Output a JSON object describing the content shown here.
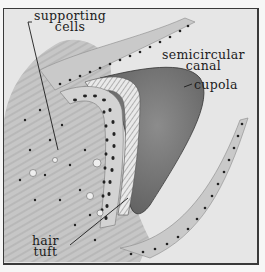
{
  "figure": {
    "style": "monochrome histology illustration",
    "colors": {
      "background": "#e6e6e6",
      "frame": "#3a3a3a",
      "cupola": "#7a7a7a",
      "nuclei": "#222222",
      "tissue": "#b9b9b9",
      "ink": "#1c1c1c"
    }
  },
  "labels": {
    "supporting_cells": {
      "line1": "supporting",
      "line2": "cells"
    },
    "semicircular_canal": {
      "line1": "semicircular",
      "line2": "canal"
    },
    "cupola": {
      "line1": "cupola"
    },
    "hair_tuft": {
      "line1": "hair",
      "line2": "tuft"
    }
  }
}
